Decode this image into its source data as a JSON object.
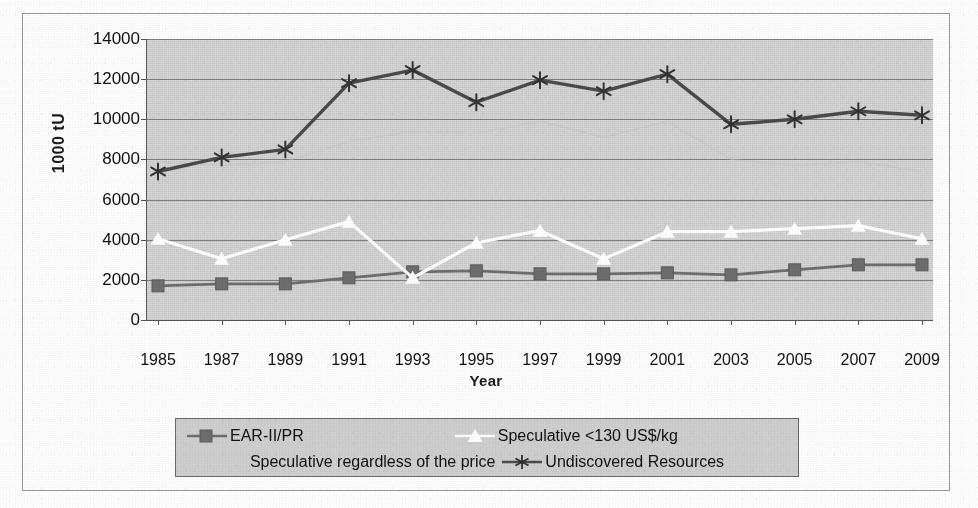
{
  "figure": {
    "y_axis_title": "1000 tU",
    "x_axis_title": "Year"
  },
  "legend": {
    "items": [
      {
        "label": "EAR-II/PR",
        "marker": "square-marker-icon",
        "color": "#6e6e6e"
      },
      {
        "label": "Speculative <130 US$/kg",
        "marker": "triangle-marker-icon",
        "color": "#ffffff"
      },
      {
        "label": "Speculative regardless of the price",
        "marker": "none",
        "color": "#c6c6c6"
      },
      {
        "label": "Undiscovered Resources",
        "marker": "star-marker-icon",
        "color": "#4a4a4a"
      }
    ]
  },
  "chart_data": {
    "type": "line",
    "title": "",
    "xlabel": "Year",
    "ylabel": "1000 tU",
    "xlim": [
      1985,
      2009
    ],
    "ylim": [
      0,
      14000
    ],
    "ytick_step": 2000,
    "grid": true,
    "legend_position": "bottom",
    "categories": [
      1985,
      1987,
      1989,
      1991,
      1993,
      1995,
      1997,
      1999,
      2001,
      2003,
      2005,
      2007,
      2009
    ],
    "ytick_labels": [
      "0",
      "2000",
      "4000",
      "6000",
      "8000",
      "10000",
      "12000",
      "14000"
    ],
    "xtick_labels": [
      "1985",
      "1987",
      "1989",
      "1991",
      "1993",
      "1995",
      "1997",
      "1999",
      "2001",
      "2003",
      "2005",
      "2007",
      "2009"
    ],
    "series": [
      {
        "name": "EAR-II/PR",
        "marker": "square",
        "color": "#6e6e6e",
        "values": [
          1700,
          1800,
          1800,
          2100,
          2400,
          2450,
          2300,
          2300,
          2350,
          2250,
          2500,
          2750,
          2750
        ]
      },
      {
        "name": "Speculative <130 US$/kg",
        "marker": "triangle",
        "color": "#ffffff",
        "values": [
          4050,
          3050,
          4000,
          4900,
          2100,
          3850,
          4450,
          3050,
          4400,
          4400,
          4550,
          4700,
          4050
        ]
      },
      {
        "name": "Speculative regardless of the price",
        "marker": "none",
        "color": "#c6c6c6",
        "values": [
          7900,
          7700,
          7900,
          8900,
          9400,
          9300,
          9900,
          9100,
          9900,
          8000,
          7700,
          7900,
          7400
        ]
      },
      {
        "name": "Undiscovered Resources",
        "marker": "star",
        "color": "#4a4a4a",
        "values": [
          7400,
          8100,
          8500,
          11800,
          12450,
          10850,
          11950,
          11400,
          12250,
          9750,
          10000,
          10400,
          10200
        ]
      }
    ]
  }
}
